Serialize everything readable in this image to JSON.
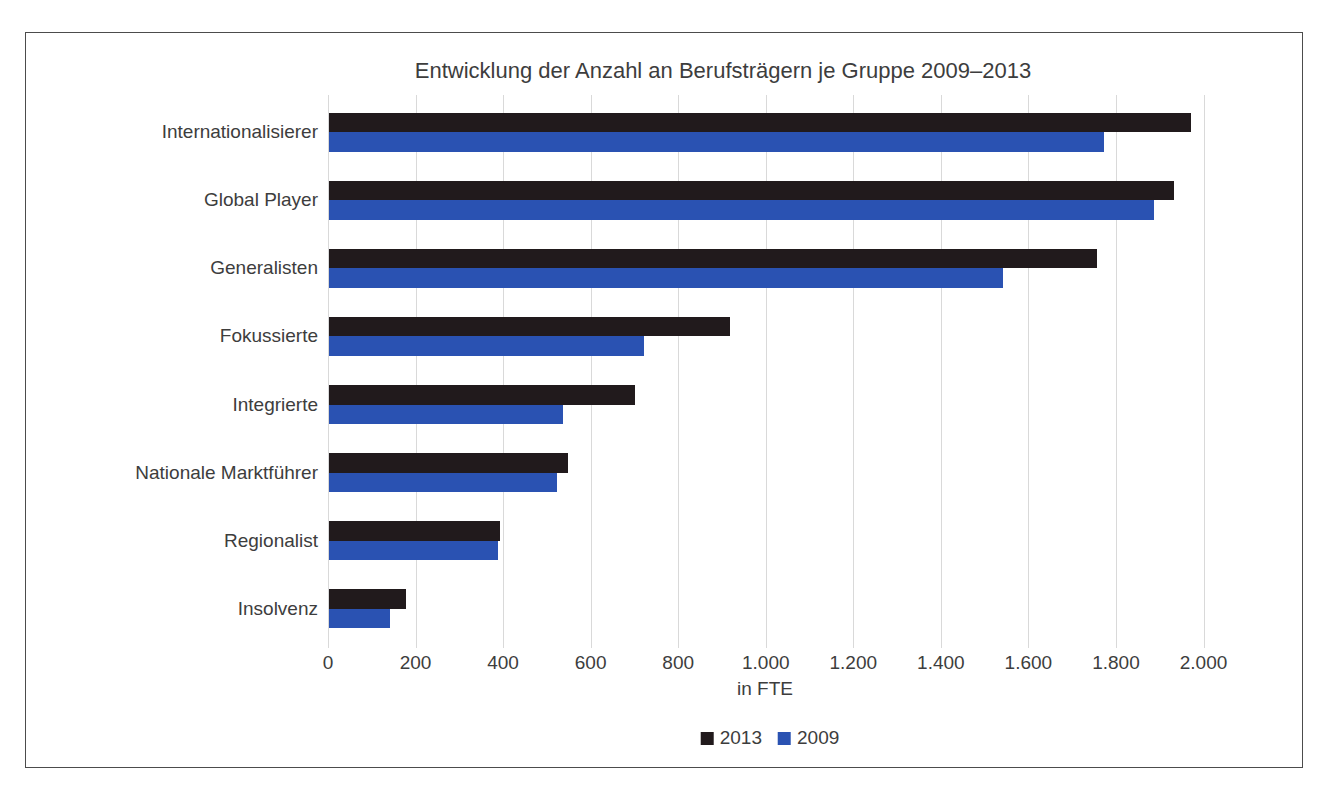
{
  "chart_data": {
    "type": "bar",
    "orientation": "horizontal",
    "title": "Entwicklung der Anzahl an Berufsträgern je Gruppe 2009–2013",
    "xlabel": "in FTE",
    "categories": [
      "Internationalisierer",
      "Global Player",
      "Generalisten",
      "Fokussierte",
      "Integrierte",
      "Nationale Marktführer",
      "Regionalist",
      "Insolvenz"
    ],
    "series": [
      {
        "name": "2013",
        "color": "#211a1c",
        "values": [
          1970,
          1930,
          1755,
          915,
          700,
          545,
          390,
          175
        ]
      },
      {
        "name": "2009",
        "color": "#2a52b2",
        "values": [
          1770,
          1885,
          1540,
          720,
          535,
          520,
          385,
          140
        ]
      }
    ],
    "xticks": {
      "values": [
        0,
        200,
        400,
        600,
        800,
        1000,
        1200,
        1400,
        1600,
        1800,
        2000
      ],
      "labels": [
        "0",
        "200",
        "400",
        "600",
        "800",
        "1.000",
        "1.200",
        "1.400",
        "1.600",
        "1.800",
        "2.000"
      ]
    },
    "xlim": [
      0,
      2200
    ],
    "grid": "vertical",
    "legend_position": "bottom",
    "colors": {
      "grid": "#d9d9d9",
      "text": "#3d3d3d",
      "frame_border": "#4c4c4c",
      "background": "#ffffff"
    }
  }
}
